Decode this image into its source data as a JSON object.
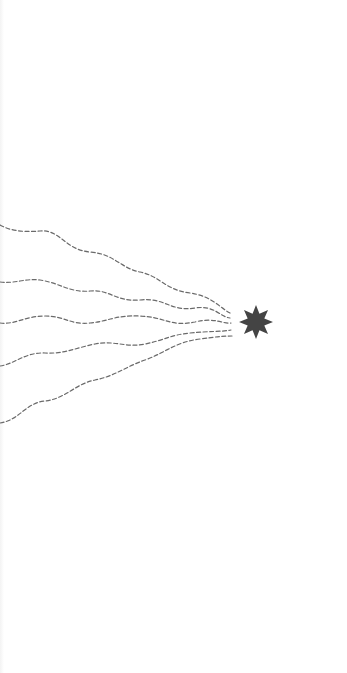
{
  "diagram": {
    "colors": {
      "background": "#ffffff",
      "line": "#6a6a6a",
      "star": "#444444"
    },
    "waves": [
      {
        "id": 1,
        "d": "M0 225 C 12 232, 28 232, 40 231 C 60 229, 65 250, 90 252 C 115 254, 120 268, 140 272 C 160 276, 165 290, 190 293 C 212 296, 220 308, 230 313"
      },
      {
        "id": 2,
        "d": "M0 282 C 15 284, 25 278, 40 280 C 60 283, 70 293, 90 291 C 110 289, 115 302, 140 300 C 165 297, 170 312, 195 308 C 215 305, 220 317, 230 318"
      },
      {
        "id": 3,
        "d": "M0 323 C 15 325, 25 316, 45 316 C 65 316, 70 325, 90 323 C 110 321, 115 315, 140 316 C 165 317, 170 327, 195 322 C 215 317, 222 324, 231 323"
      },
      {
        "id": 4,
        "d": "M0 366 C 15 364, 25 352, 45 353 C 65 354, 75 348, 95 344 C 115 340, 125 348, 145 344 C 165 340, 170 335, 190 333 C 210 331, 220 332, 231 330"
      },
      {
        "id": 5,
        "d": "M0 423 C 20 420, 25 403, 45 401 C 65 399, 75 384, 95 380 C 115 376, 125 367, 145 360 C 165 353, 175 342, 200 339 C 215 337, 222 336, 232 336"
      }
    ],
    "star": {
      "cx": 256,
      "cy": 322,
      "outer_r": 17,
      "inner_r": 9,
      "points": 8
    }
  }
}
